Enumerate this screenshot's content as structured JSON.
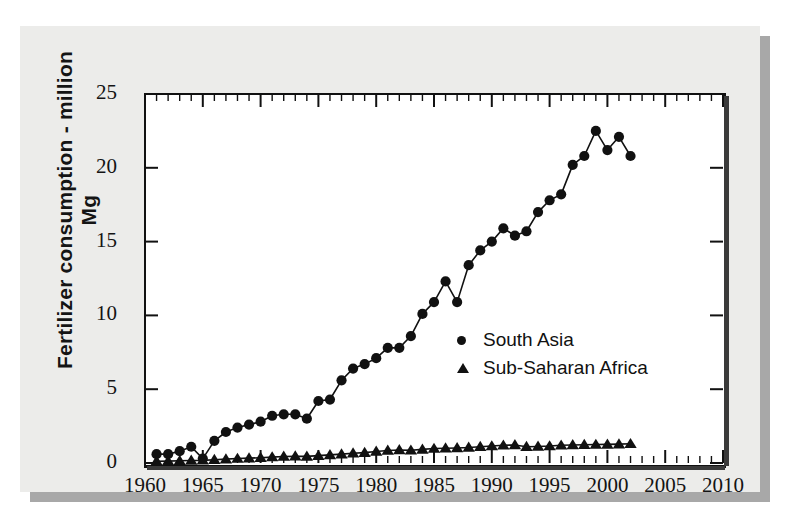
{
  "chart_data": {
    "type": "line",
    "title": "",
    "xlabel": "",
    "ylabel": "Fertilizer consumption - million Mg",
    "xlim": [
      1960,
      2010
    ],
    "ylim": [
      0,
      25
    ],
    "xticks": [
      1960,
      1965,
      1970,
      1975,
      1980,
      1985,
      1990,
      1995,
      2000,
      2005,
      2010
    ],
    "xtick_labels": [
      "1960",
      "1965",
      "1970",
      "1975",
      "1980",
      "1985",
      "1990",
      "1995",
      "2000",
      "2005",
      "2010"
    ],
    "yticks": [
      0,
      5,
      10,
      15,
      20,
      25
    ],
    "ytick_labels": [
      "0",
      "5",
      "10",
      "15",
      "20",
      "25"
    ],
    "minor_xtick_step": 1,
    "grid": false,
    "legend_position": "center",
    "series": [
      {
        "name": "South Asia",
        "marker": "circle",
        "color": "#111111",
        "x": [
          1961,
          1962,
          1963,
          1964,
          1965,
          1966,
          1967,
          1968,
          1969,
          1970,
          1971,
          1972,
          1973,
          1974,
          1975,
          1976,
          1977,
          1978,
          1979,
          1980,
          1981,
          1982,
          1983,
          1984,
          1985,
          1986,
          1987,
          1988,
          1989,
          1990,
          1991,
          1992,
          1993,
          1994,
          1995,
          1996,
          1997,
          1998,
          1999,
          2000,
          2001,
          2002
        ],
        "values": [
          0.6,
          0.6,
          0.8,
          1.1,
          0.3,
          1.5,
          2.1,
          2.4,
          2.6,
          2.8,
          3.2,
          3.3,
          3.3,
          3.0,
          4.2,
          4.3,
          5.6,
          6.4,
          6.7,
          7.1,
          7.8,
          7.8,
          8.6,
          10.1,
          10.9,
          12.3,
          10.9,
          13.4,
          14.4,
          15.0,
          15.9,
          15.4,
          15.7,
          17.0,
          17.8,
          18.2,
          20.2,
          20.8,
          22.5,
          21.2,
          22.1,
          20.8
        ]
      },
      {
        "name": "Sub-Saharan Africa",
        "marker": "triangle",
        "color": "#111111",
        "x": [
          1961,
          1962,
          1963,
          1964,
          1965,
          1966,
          1967,
          1968,
          1969,
          1970,
          1971,
          1972,
          1973,
          1974,
          1975,
          1976,
          1977,
          1978,
          1979,
          1980,
          1981,
          1982,
          1983,
          1984,
          1985,
          1986,
          1987,
          1988,
          1989,
          1990,
          1991,
          1992,
          1993,
          1994,
          1995,
          1996,
          1997,
          1998,
          1999,
          2000,
          2001,
          2002
        ],
        "values": [
          0.12,
          0.13,
          0.15,
          0.17,
          0.18,
          0.22,
          0.26,
          0.3,
          0.33,
          0.36,
          0.4,
          0.44,
          0.46,
          0.45,
          0.5,
          0.55,
          0.6,
          0.66,
          0.7,
          0.78,
          0.85,
          0.88,
          0.86,
          0.92,
          0.98,
          1.0,
          1.02,
          1.05,
          1.1,
          1.15,
          1.2,
          1.22,
          1.1,
          1.12,
          1.15,
          1.2,
          1.22,
          1.24,
          1.25,
          1.26,
          1.28,
          1.3
        ]
      }
    ]
  },
  "legend": {
    "entries": [
      {
        "label": "South Asia",
        "marker": "circle"
      },
      {
        "label": "Sub-Saharan Africa",
        "marker": "triangle"
      }
    ]
  },
  "colors": {
    "page_background": "#ffffff",
    "panel_background": "#ececea",
    "panel_shadow": "#a8a8a8",
    "plot_background": "#ffffff",
    "ink": "#111111"
  }
}
